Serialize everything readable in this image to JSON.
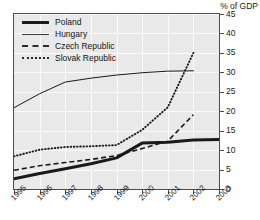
{
  "chart_data": {
    "type": "line",
    "title": "",
    "subtitle": "",
    "xlabel": "",
    "ylabel": "% of GDP",
    "x": [
      "1995",
      "1996",
      "1997",
      "1998",
      "1999",
      "2000",
      "2001",
      "2002",
      "2003"
    ],
    "xtick_labels": [
      "1995",
      "1996",
      "1997",
      "1998",
      "1999",
      "2000",
      "2001",
      "2002",
      "2003"
    ],
    "ytick_labels": [
      "0",
      "5",
      "10",
      "15",
      "20",
      "25",
      "30",
      "35",
      "40",
      "45"
    ],
    "ytick_values": [
      0,
      5,
      10,
      15,
      20,
      25,
      30,
      35,
      40,
      45
    ],
    "ylim": [
      0,
      45
    ],
    "grid": true,
    "legend_position": "top-left",
    "series": [
      {
        "name": "Poland",
        "style": "thick-solid",
        "x": [
          "1995",
          "1996",
          "1997",
          "1998",
          "1999",
          "2000",
          "2001",
          "2002",
          "2003"
        ],
        "values": [
          2.6,
          4.0,
          5.2,
          6.5,
          8.0,
          11.8,
          12.0,
          12.6,
          12.7
        ]
      },
      {
        "name": "Hungary",
        "style": "thin-solid",
        "x": [
          "1995",
          "1996",
          "1997",
          "1998",
          "1999",
          "2000",
          "2001",
          "2002"
        ],
        "values": [
          20.9,
          24.5,
          27.5,
          28.5,
          29.3,
          29.9,
          30.3,
          30.4
        ]
      },
      {
        "name": "Czech Republic",
        "style": "dashed",
        "x": [
          "1995",
          "1996",
          "1997",
          "1998",
          "1999",
          "2000",
          "2001",
          "2002"
        ],
        "values": [
          4.8,
          6.0,
          6.8,
          7.6,
          8.6,
          10.4,
          12.3,
          19.1
        ]
      },
      {
        "name": "Slovak Republic",
        "style": "dotted",
        "x": [
          "1995",
          "1996",
          "1997",
          "1998",
          "1999",
          "2000",
          "2001",
          "2002"
        ],
        "values": [
          8.4,
          10.1,
          10.8,
          11.0,
          11.3,
          15.2,
          21.0,
          35.0
        ]
      }
    ]
  },
  "legend": {
    "items": [
      {
        "label": "Poland",
        "swatch": "thick-solid-line-icon"
      },
      {
        "label": "Hungary",
        "swatch": "thin-solid-line-icon"
      },
      {
        "label": "Czech Republic",
        "swatch": "dashed-line-icon"
      },
      {
        "label": "Slovak Republic",
        "swatch": "dotted-line-icon"
      }
    ]
  },
  "colors": {
    "plot_background": "#e9e9e9",
    "gridline": "#fbfbfb",
    "axis": "#4d4d4d",
    "series_line": "#1a1a1a",
    "text": "#1a1a1a"
  }
}
